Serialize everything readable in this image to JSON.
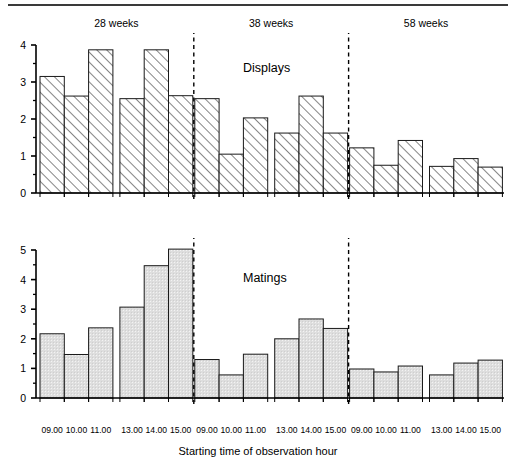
{
  "figure": {
    "xaxis_title": "Starting time of observation hour",
    "group_headers": [
      "28 weeks",
      "38 weeks",
      "58 weeks"
    ],
    "panel_titles": [
      "Displays",
      "Matings"
    ],
    "colors": {
      "axis": "#000000",
      "bar_outline": "#1a1a1a",
      "hatch_line": "#2b2b2b",
      "stipple_fill": "#d9d9d9",
      "divider": "#000000",
      "top_rule": "#3a3a3a"
    }
  },
  "chart_data": [
    {
      "type": "bar",
      "title": "Displays",
      "xlabel": "Starting time of observation hour",
      "ylabel": "",
      "ylim": [
        0,
        4
      ],
      "yticks": [
        0,
        1,
        2,
        3,
        4
      ],
      "yticklabels": [
        "0",
        "1",
        "2",
        "3",
        "4"
      ],
      "minor_tick_step": 0.5,
      "grid": false,
      "bar_style": "diagonal-hatch",
      "groups": [
        "28 weeks",
        "38 weeks",
        "58 weeks"
      ],
      "categories": [
        "09.00",
        "10.00",
        "11.00",
        "13.00",
        "14.00",
        "15.00",
        "09.00",
        "10.00",
        "11.00",
        "13.00",
        "14.00",
        "15.00",
        "09.00",
        "10.00",
        "11.00",
        "13.00",
        "14.00",
        "15.00"
      ],
      "values": [
        3.15,
        2.62,
        3.87,
        2.55,
        3.87,
        2.63,
        2.55,
        1.05,
        2.03,
        1.62,
        2.62,
        1.62,
        1.22,
        0.75,
        1.42,
        0.72,
        0.93,
        0.7
      ]
    },
    {
      "type": "bar",
      "title": "Matings",
      "xlabel": "Starting time of observation hour",
      "ylabel": "",
      "ylim": [
        0,
        5
      ],
      "yticks": [
        0,
        1,
        2,
        3,
        4,
        5
      ],
      "yticklabels": [
        "0",
        "1",
        "2",
        "3",
        "4",
        "5"
      ],
      "minor_tick_step": 0.5,
      "grid": false,
      "bar_style": "solid-light-gray",
      "groups": [
        "28 weeks",
        "38 weeks",
        "58 weeks"
      ],
      "categories": [
        "09.00",
        "10.00",
        "11.00",
        "13.00",
        "14.00",
        "15.00",
        "09.00",
        "10.00",
        "11.00",
        "13.00",
        "14.00",
        "15.00",
        "09.00",
        "10.00",
        "11.00",
        "13.00",
        "14.00",
        "15.00"
      ],
      "values": [
        2.17,
        1.47,
        2.37,
        3.07,
        4.47,
        5.03,
        1.3,
        0.78,
        1.48,
        2.0,
        2.67,
        2.35,
        0.98,
        0.88,
        1.08,
        0.78,
        1.18,
        1.28
      ]
    }
  ]
}
